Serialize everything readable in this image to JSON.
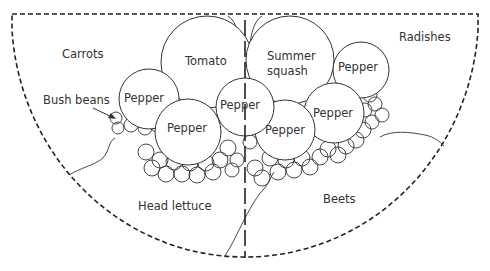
{
  "diagram": {
    "type": "garden-bed-plan",
    "shape": "semicircle bed divided by center line",
    "colors": {
      "stroke": "#333333",
      "background": "#ffffff"
    },
    "sections": {
      "carrots": "Carrots",
      "radishes": "Radishes",
      "head_lettuce": "Head lettuce",
      "beets": "Beets"
    },
    "plants": {
      "tomato": "Tomato",
      "summer_squash_line1": "Summer",
      "summer_squash_line2": "squash",
      "pepper": "Pepper",
      "bush_beans": "Bush beans"
    },
    "pepper_count": 6
  }
}
